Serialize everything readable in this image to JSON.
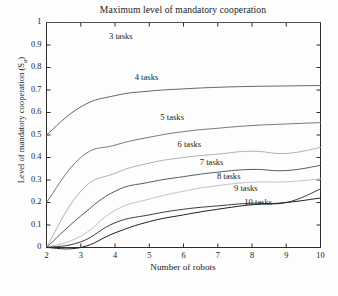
{
  "chart_data": {
    "type": "line",
    "title": "Maximum level of mandatory cooperation",
    "xlabel": "Number of robots",
    "ylabel": "Level of mandatory cooperation (S",
    "ylabel_sub": "a",
    "ylabel_close": ")",
    "xlim": [
      2,
      10
    ],
    "ylim": [
      0,
      1
    ],
    "grid": false,
    "legend_position": "inline-annotations",
    "x": [
      2,
      3,
      4,
      5,
      6,
      7,
      8,
      9,
      10
    ],
    "xticks": [
      "2",
      "3",
      "4",
      "5",
      "6",
      "7",
      "8",
      "9",
      "10"
    ],
    "yticks": [
      "0",
      "0.1",
      "0.2",
      "0.3",
      "0.4",
      "0.5",
      "0.6",
      "0.7",
      "0.8",
      "0.9",
      "1"
    ],
    "ytick_values": [
      0,
      0.1,
      0.2,
      0.3,
      0.4,
      0.5,
      0.6,
      0.7,
      0.8,
      0.9,
      1
    ],
    "series": [
      {
        "name": "3 tasks",
        "color": "#555555",
        "label_x": 4.35,
        "label_y": 0.935,
        "values": [
          1.0,
          1.0,
          1.0,
          1.0,
          1.0,
          1.0,
          1.0,
          1.0,
          1.0
        ]
      },
      {
        "name": "4 tasks",
        "color": "#666666",
        "label_x": 5.1,
        "label_y": 0.755,
        "values": [
          0.5,
          0.625,
          0.675,
          0.695,
          0.705,
          0.712,
          0.716,
          0.718,
          0.72
        ]
      },
      {
        "name": "5 tasks",
        "color": "#777777",
        "label_x": 5.85,
        "label_y": 0.575,
        "values": [
          0.2,
          0.4,
          0.455,
          0.49,
          0.515,
          0.53,
          0.542,
          0.549,
          0.555
        ]
      },
      {
        "name": "6 tasks",
        "color": "#b0b0b0",
        "label_x": 6.35,
        "label_y": 0.455,
        "values": [
          0.0,
          0.25,
          0.33,
          0.375,
          0.4,
          0.415,
          0.428,
          0.418,
          0.445
        ]
      },
      {
        "name": "7 tasks",
        "color": "#5a5a5a",
        "label_x": 7.0,
        "label_y": 0.375,
        "values": [
          0.0,
          0.14,
          0.25,
          0.29,
          0.315,
          0.335,
          0.347,
          0.342,
          0.365
        ]
      },
      {
        "name": "8 tasks",
        "color": "#c2c2c2",
        "label_x": 7.5,
        "label_y": 0.315,
        "values": [
          0.0,
          0.05,
          0.165,
          0.215,
          0.25,
          0.275,
          0.29,
          0.292,
          0.305
        ]
      },
      {
        "name": "9 tasks",
        "color": "#3c3c3c",
        "label_x": 8.0,
        "label_y": 0.262,
        "values": [
          0.0,
          0.025,
          0.11,
          0.145,
          0.17,
          0.185,
          0.197,
          0.2,
          0.26
        ]
      },
      {
        "name": "10 tasks",
        "color": "#1f1f1f",
        "label_x": 8.3,
        "label_y": 0.198,
        "values": [
          0.0,
          0.0,
          0.065,
          0.115,
          0.145,
          0.17,
          0.19,
          0.2,
          0.22
        ]
      }
    ]
  }
}
